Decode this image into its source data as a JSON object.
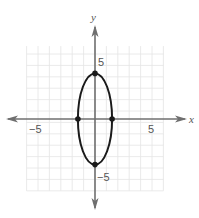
{
  "chart_data": {
    "type": "line",
    "title": "",
    "xlabel": "x",
    "ylabel": "y",
    "xlim": [
      -6,
      6
    ],
    "ylim": [
      -6,
      6
    ],
    "grid": true,
    "x_tick_labels": [
      {
        "value": -5,
        "label": "−5"
      },
      {
        "value": 5,
        "label": "5"
      }
    ],
    "y_tick_labels": [
      {
        "value": 5,
        "label": "5"
      },
      {
        "value": -5,
        "label": "−5"
      }
    ],
    "curve": {
      "shape": "ellipse",
      "center": [
        0,
        0
      ],
      "semi_x": 1.5,
      "semi_y": 4
    },
    "points": [
      [
        0,
        4
      ],
      [
        0,
        -4
      ],
      [
        -1.5,
        0
      ],
      [
        1.5,
        0
      ]
    ]
  },
  "colors": {
    "grid": "#e4e4e4",
    "axis": "#6f6f6f",
    "curve": "#1a1a1a"
  }
}
